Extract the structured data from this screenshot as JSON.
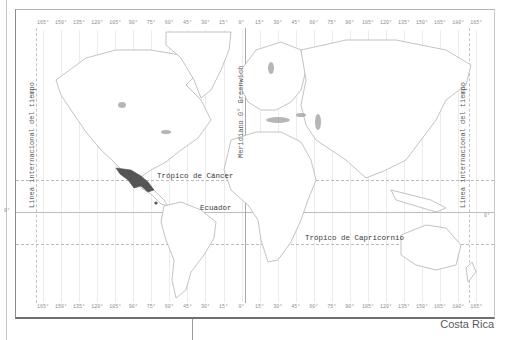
{
  "map": {
    "type": "world-political-outline",
    "longitude_labels_top": [
      "165°",
      "150°",
      "135°",
      "120°",
      "105°",
      "90°",
      "75°",
      "60°",
      "45°",
      "30°",
      "15°",
      "0°",
      "15°",
      "30°",
      "45°",
      "60°",
      "75°",
      "90°",
      "105°",
      "120°",
      "135°",
      "150°",
      "165°",
      "180°",
      "165°"
    ],
    "longitude_labels_bottom": [
      "165°",
      "150°",
      "135°",
      "120°",
      "105°",
      "90°",
      "75°",
      "60°",
      "45°",
      "30°",
      "15°",
      "0°",
      "15°",
      "30°",
      "45°",
      "60°",
      "75°",
      "90°",
      "105°",
      "120°",
      "135°",
      "150°",
      "165°",
      "180°",
      "165°"
    ],
    "equator_degree_left": "0°",
    "equator_degree_right": "0°",
    "labels": {
      "tropic_cancer": "Trópico de Cáncer",
      "equator": "Ecuador",
      "tropic_capricorn": "Trópico de Capricornio",
      "greenwich": "Meridiano 0° Greenwich",
      "date_line_left": "Línea internacional del tiempo",
      "date_line_right": "Línea internacional del tiempo"
    },
    "highlighted_region": "Mexico",
    "highlight_color": "#555555",
    "land_outline_color": "#b0b0b0",
    "water_shade_color": "#9a9a9a"
  },
  "caption": "Costa Rica"
}
